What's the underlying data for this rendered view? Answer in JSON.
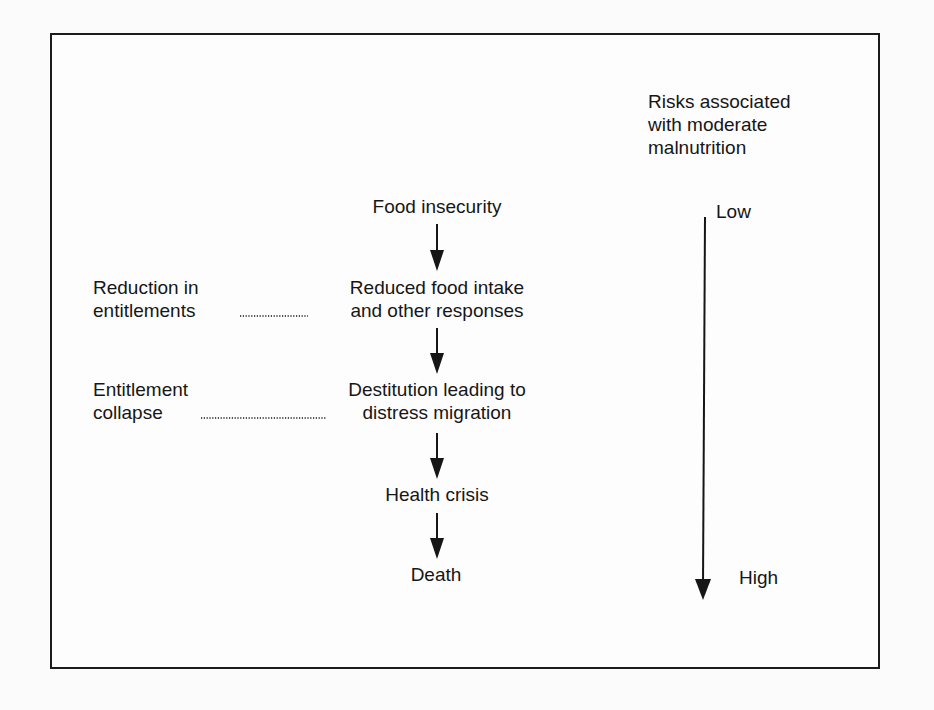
{
  "diagram": {
    "flow_nodes": [
      {
        "id": "food-insecurity",
        "text": "Food insecurity"
      },
      {
        "id": "reduced-intake",
        "text": "Reduced food intake\nand other responses"
      },
      {
        "id": "destitution",
        "text": "Destitution leading to\ndistress migration"
      },
      {
        "id": "health-crisis",
        "text": "Health crisis"
      },
      {
        "id": "death",
        "text": "Death"
      }
    ],
    "side_labels": [
      {
        "id": "reduction-entitlements",
        "text": "Reduction in\nentitlements",
        "links_to": "reduced-intake"
      },
      {
        "id": "entitlement-collapse",
        "text": "Entitlement\ncollapse",
        "links_to": "destitution"
      }
    ],
    "risk_scale": {
      "title": "Risks associated\nwith moderate\nmalnutrition",
      "low_label": "Low",
      "high_label": "High"
    },
    "colors": {
      "ink": "#161616",
      "background": "#fbfbfb",
      "frame": "#1c1c1c"
    }
  }
}
